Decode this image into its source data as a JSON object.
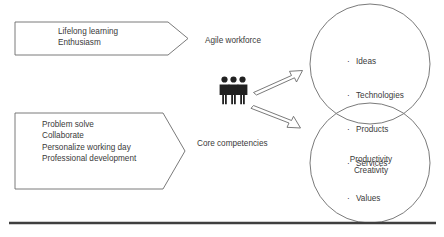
{
  "diagram": {
    "banners": [
      {
        "id": "banner-top",
        "name": "lifelong-learning-banner",
        "lines": [
          "Lifelong learning",
          "Enthusiasm"
        ],
        "text": "Lifelong learning\nEnthusiasm"
      },
      {
        "id": "banner-bottom",
        "name": "core-competencies-banner",
        "lines": [
          "Problem solve",
          "Collaborate",
          "Personalize working day",
          "Professional development"
        ],
        "text": "Problem solve\nCollaborate\nPersonalize working day\nProfessional development"
      }
    ],
    "labels": {
      "agile_workforce": "Agile workforce",
      "core_competencies": "Core competencies"
    },
    "people_icon": "three-people-icon",
    "arrows": [
      {
        "name": "arrow-to-outputs",
        "direction": "up-right"
      },
      {
        "name": "arrow-to-outcomes",
        "direction": "down-right"
      }
    ],
    "circles": [
      {
        "id": "circle-top",
        "name": "outputs-circle",
        "items": [
          "Ideas",
          "Technologies",
          "Products",
          "Services",
          "Values"
        ]
      },
      {
        "id": "circle-bottom",
        "name": "outcomes-circle",
        "lines": [
          "Productivity",
          "Creativity"
        ],
        "text": "Productivity\nCreativity"
      }
    ],
    "baseline_rule": "horizontal-divider",
    "colors": {
      "stroke": "#595959",
      "text": "#3a3a3a",
      "people": "#222222",
      "rule": "#3f3f3f",
      "background": "#ffffff"
    }
  }
}
